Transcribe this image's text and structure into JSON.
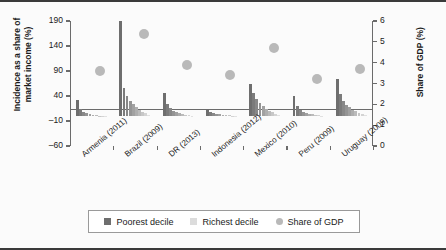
{
  "chart_data": {
    "type": "bar",
    "title": "",
    "ylabel": "Incidence as a share of\nmarket income (%)",
    "ylabel_right": "Share of GDP (%)",
    "xlabel": "",
    "ylim": [
      -60,
      190
    ],
    "yticks": [
      190,
      140,
      90,
      40,
      -10,
      -60
    ],
    "ylim_right": [
      0,
      6
    ],
    "yticks_right": [
      6,
      5,
      4,
      3,
      2,
      1,
      0
    ],
    "grid": false,
    "legend_position": "bottom",
    "legend": [
      {
        "label": "Poorest decile",
        "marker": "square",
        "color": "#6e6e6e"
      },
      {
        "label": "Richest decile",
        "marker": "square",
        "color": "#d8d8d8"
      },
      {
        "label": "Share of GDP",
        "marker": "circle",
        "color": "#b9b9b9"
      }
    ],
    "categories": [
      "Armenia (2011)",
      "Brazil (2009)",
      "DR (2013)",
      "Indonesia (2012)",
      "Mexico (2010)",
      "Peru (2009)",
      "Uruguay (2009)"
    ],
    "series": [
      {
        "name": "Incidence by decile (poorest to richest)",
        "axis": "left",
        "groups": [
          {
            "category": "Armenia (2011)",
            "values": [
              32,
              14,
              9,
              6,
              4,
              3,
              2,
              1,
              1,
              0
            ]
          },
          {
            "category": "Brazil (2009)",
            "values": [
              190,
              57,
              41,
              31,
              24,
              18,
              13,
              9,
              6,
              3
            ]
          },
          {
            "category": "DR (2013)",
            "values": [
              47,
              25,
              16,
              11,
              8,
              6,
              4,
              3,
              2,
              1
            ]
          },
          {
            "category": "Indonesia (2012)",
            "values": [
              13,
              8,
              6,
              5,
              4,
              3,
              2,
              2,
              1,
              1
            ]
          },
          {
            "category": "Mexico (2010)",
            "values": [
              64,
              46,
              34,
              26,
              20,
              15,
              11,
              8,
              5,
              2
            ]
          },
          {
            "category": "Peru (2009)",
            "values": [
              40,
              20,
              13,
              9,
              7,
              5,
              4,
              3,
              2,
              1
            ]
          },
          {
            "category": "Uruguay (2009)",
            "values": [
              74,
              44,
              31,
              23,
              18,
              13,
              10,
              7,
              4,
              2
            ]
          }
        ]
      },
      {
        "name": "Share of GDP",
        "axis": "right",
        "values": [
          3.6,
          5.4,
          3.9,
          3.4,
          4.7,
          3.2,
          3.7
        ]
      }
    ]
  },
  "legend": {
    "poorest": "Poorest decile",
    "richest": "Richest decile",
    "gdp": "Share of GDP"
  },
  "axes": {
    "left_title": "Incidence as a share of\nmarket income (%)",
    "right_title": "Share of GDP (%)"
  }
}
